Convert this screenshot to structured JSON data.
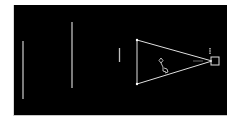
{
  "viewport": {
    "background": "#000000",
    "line_color": "#d9d9d9"
  },
  "scene": {
    "objects": [
      {
        "name": "vertical-line-1",
        "type": "line",
        "x1": 23,
        "y1": 41,
        "x2": 23,
        "y2": 99
      },
      {
        "name": "vertical-line-2",
        "type": "line",
        "x1": 72,
        "y1": 22,
        "x2": 72,
        "y2": 88
      },
      {
        "name": "vertical-line-3",
        "type": "line",
        "x1": 119.5,
        "y1": 48,
        "x2": 119.5,
        "y2": 62
      },
      {
        "name": "camera-frustum",
        "type": "triangle",
        "points": [
          [
            137,
            40
          ],
          [
            137,
            84
          ],
          [
            212,
            61
          ]
        ]
      },
      {
        "name": "camera-body",
        "type": "rect",
        "x": 211,
        "y": 57,
        "w": 8,
        "h": 8
      },
      {
        "name": "camera-up-indicator",
        "type": "line",
        "x1": 210,
        "y1": 48,
        "x2": 210,
        "y2": 54
      },
      {
        "name": "camera-sight-line",
        "type": "line",
        "x1": 193,
        "y1": 61,
        "x2": 203,
        "y2": 61
      },
      {
        "name": "figure-glyph",
        "type": "path"
      }
    ]
  }
}
